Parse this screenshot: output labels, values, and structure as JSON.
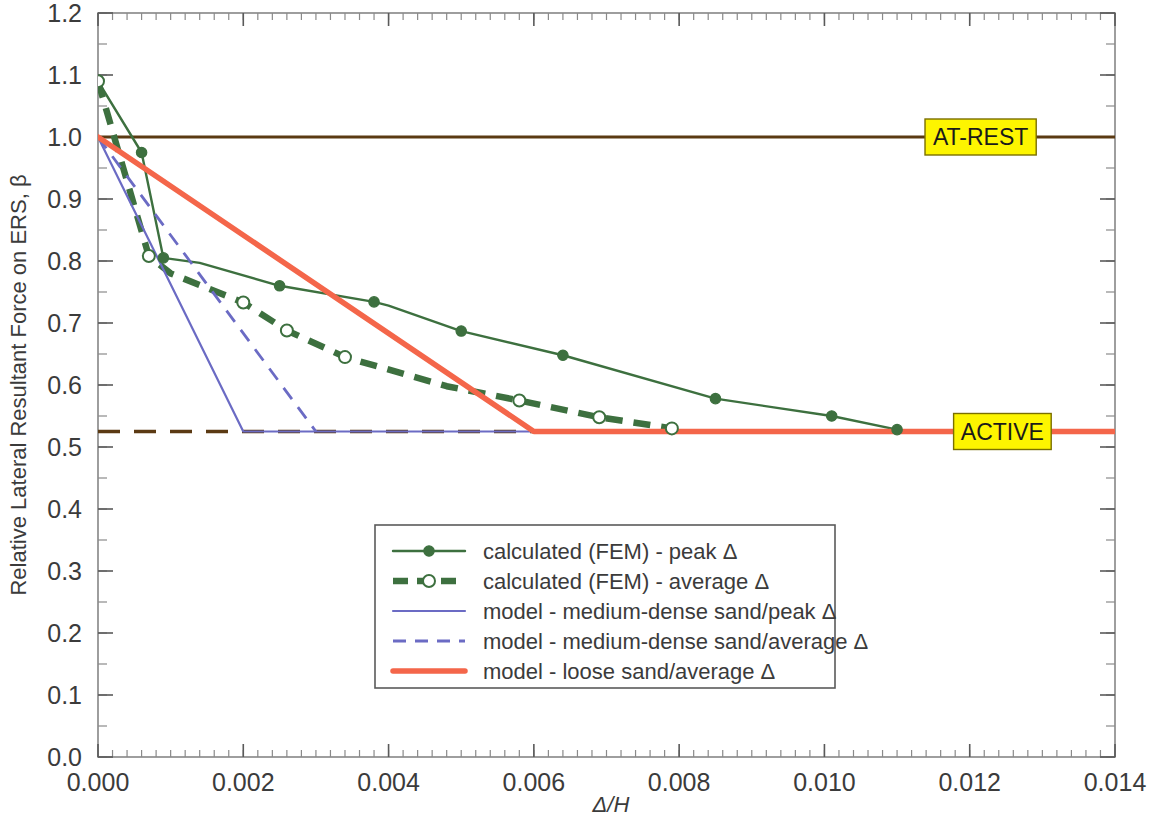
{
  "chart_data": {
    "type": "line",
    "title": "",
    "xlabel": "Δ/H",
    "ylabel": "Relative Lateral Resultant Force on ERS, β",
    "xlim": [
      0.0,
      0.014
    ],
    "ylim": [
      0.0,
      1.2
    ],
    "x_ticks": [
      "0.000",
      "0.002",
      "0.004",
      "0.006",
      "0.008",
      "0.010",
      "0.012",
      "0.014"
    ],
    "x_tick_values": [
      0.0,
      0.002,
      0.004,
      0.006,
      0.008,
      0.01,
      0.012,
      0.014
    ],
    "x_minor_step": 0.0002,
    "y_ticks": [
      "0.0",
      "0.1",
      "0.2",
      "0.3",
      "0.4",
      "0.5",
      "0.6",
      "0.7",
      "0.8",
      "0.9",
      "1.0",
      "1.1",
      "1.2"
    ],
    "y_tick_values": [
      0.0,
      0.1,
      0.2,
      0.3,
      0.4,
      0.5,
      0.6,
      0.7,
      0.8,
      0.9,
      1.0,
      1.1,
      1.2
    ],
    "y_minor_step": 0.05,
    "grid": false,
    "legend_position": "lower-center",
    "series": [
      {
        "name": "calculated (FEM) - peak Δ",
        "key": "fem_peak",
        "color": "#3d703f",
        "style": "solid",
        "width": 2.4,
        "marker": "filled-circle",
        "points": [
          [
            0.0,
            1.09
          ],
          [
            0.0006,
            0.975
          ],
          [
            0.0009,
            0.805
          ],
          [
            0.0014,
            0.797
          ],
          [
            0.0025,
            0.76
          ],
          [
            0.0038,
            0.734
          ],
          [
            0.004,
            0.728
          ],
          [
            0.005,
            0.687
          ],
          [
            0.0064,
            0.648
          ],
          [
            0.0085,
            0.578
          ],
          [
            0.0101,
            0.55
          ],
          [
            0.011,
            0.528
          ]
        ],
        "marker_points": [
          [
            0.0,
            1.09
          ],
          [
            0.0006,
            0.975
          ],
          [
            0.0009,
            0.805
          ],
          [
            0.0025,
            0.76
          ],
          [
            0.0038,
            0.734
          ],
          [
            0.005,
            0.687
          ],
          [
            0.0064,
            0.648
          ],
          [
            0.0085,
            0.578
          ],
          [
            0.0101,
            0.55
          ],
          [
            0.011,
            0.528
          ]
        ]
      },
      {
        "name": "calculated (FEM) - average Δ",
        "key": "fem_average",
        "color": "#3d703f",
        "style": "dashed",
        "width": 6.5,
        "marker": "open-circle",
        "points": [
          [
            0.0,
            1.09
          ],
          [
            0.0007,
            0.808
          ],
          [
            0.001,
            0.78
          ],
          [
            0.002,
            0.733
          ],
          [
            0.0026,
            0.688
          ],
          [
            0.0034,
            0.645
          ],
          [
            0.0048,
            0.598
          ],
          [
            0.0058,
            0.575
          ],
          [
            0.0069,
            0.548
          ],
          [
            0.0079,
            0.53
          ]
        ],
        "marker_points": [
          [
            0.0,
            1.09
          ],
          [
            0.0007,
            0.808
          ],
          [
            0.002,
            0.733
          ],
          [
            0.0026,
            0.688
          ],
          [
            0.0034,
            0.645
          ],
          [
            0.0058,
            0.575
          ],
          [
            0.0069,
            0.548
          ],
          [
            0.0079,
            0.53
          ]
        ]
      },
      {
        "name": "model - medium-dense sand/peak Δ",
        "key": "model_md_peak",
        "color": "#6b6bc4",
        "style": "solid",
        "width": 2.2,
        "marker": "none",
        "points": [
          [
            0.0,
            1.0
          ],
          [
            0.002,
            0.525
          ],
          [
            0.014,
            0.525
          ]
        ],
        "marker_points": []
      },
      {
        "name": "model - medium-dense sand/average Δ",
        "key": "model_md_average",
        "color": "#6b6bc4",
        "style": "dashed",
        "width": 2.8,
        "marker": "none",
        "points": [
          [
            0.0,
            1.0
          ],
          [
            0.003,
            0.525
          ]
        ],
        "marker_points": []
      },
      {
        "name": "model - loose sand/average Δ",
        "key": "model_loose_average",
        "color": "#f4664a",
        "style": "solid",
        "width": 5.5,
        "marker": "none",
        "points": [
          [
            0.0,
            1.0
          ],
          [
            0.006,
            0.525
          ],
          [
            0.014,
            0.525
          ]
        ],
        "marker_points": []
      }
    ],
    "reference_lines": [
      {
        "key": "at_rest",
        "label": "AT-REST",
        "value": 1.0,
        "color": "#5b3a13",
        "style": "solid",
        "width": 3.0,
        "label_x": 0.01215
      },
      {
        "key": "active",
        "label": "ACTIVE",
        "value": 0.525,
        "color": "#5b3a13",
        "style": "dashed",
        "width": 3.4,
        "label_x": 0.01245
      }
    ]
  },
  "legend": {
    "entries": [
      {
        "label": "calculated (FEM) - peak Δ"
      },
      {
        "label": "calculated (FEM) - average Δ"
      },
      {
        "label": "model - medium-dense sand/peak Δ"
      },
      {
        "label": "model - medium-dense sand/average Δ"
      },
      {
        "label": "model - loose sand/average Δ"
      }
    ]
  },
  "annotations": [
    {
      "label": "AT-REST"
    },
    {
      "label": "ACTIVE"
    }
  ],
  "colors": {
    "fem_green": "#3d703f",
    "model_blue": "#6b6bc4",
    "model_orange": "#f4664a",
    "reference_brown": "#5b3a13",
    "annotation_yellow": "#fdf500",
    "axis_gray": "#868686"
  }
}
